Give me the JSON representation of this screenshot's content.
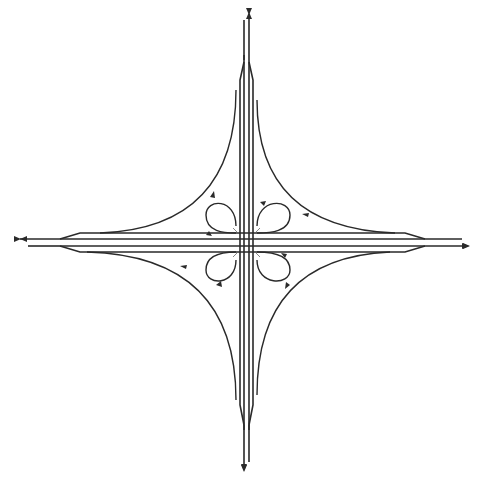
{
  "diagram": {
    "title": "",
    "type": "cloverleaf-interchange",
    "colors": {
      "line": "#2a2a2a",
      "background": "#ffffff"
    },
    "highways": [
      {
        "name": "north-south-highway",
        "direction_arrows": [
          "north",
          "south"
        ]
      },
      {
        "name": "east-west-highway",
        "direction_arrows": [
          "west",
          "east"
        ]
      }
    ],
    "loop_ramps": [
      "northwest-loop",
      "northeast-loop",
      "southwest-loop",
      "southeast-loop"
    ],
    "outer_ramps": [
      "northwest-outer-ramp",
      "northeast-outer-ramp",
      "southwest-outer-ramp",
      "southeast-outer-ramp"
    ],
    "labels": []
  }
}
